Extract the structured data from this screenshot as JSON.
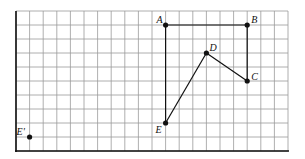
{
  "grid": {
    "origin_x": 16,
    "origin_y": 11,
    "cols": 20,
    "rows": 10,
    "cell_w": 13.6,
    "cell_h": 14,
    "line_color": "#9a9a9a",
    "axis_color": "#111111"
  },
  "points": [
    {
      "id": "A",
      "label": "A",
      "col": 11,
      "row": 1,
      "label_dx": -9,
      "label_dy": -2
    },
    {
      "id": "B",
      "label": "B",
      "col": 17,
      "row": 1,
      "label_dx": 4,
      "label_dy": -2
    },
    {
      "id": "C",
      "label": "C",
      "col": 17,
      "row": 5,
      "label_dx": 4,
      "label_dy": -1
    },
    {
      "id": "D",
      "label": "D",
      "col": 14,
      "row": 3,
      "label_dx": 3,
      "label_dy": -2
    },
    {
      "id": "E",
      "label": "E",
      "col": 11,
      "row": 8,
      "label_dx": -10,
      "label_dy": 10
    },
    {
      "id": "E_prime",
      "label": "E'",
      "col": 1,
      "row": 9,
      "label_dx": -13,
      "label_dy": -2
    }
  ],
  "segments": [
    [
      "A",
      "B"
    ],
    [
      "B",
      "C"
    ],
    [
      "C",
      "D"
    ],
    [
      "D",
      "E"
    ],
    [
      "E",
      "A"
    ]
  ]
}
